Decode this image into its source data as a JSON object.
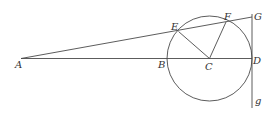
{
  "diagram": {
    "type": "geometry",
    "points": {
      "A": {
        "label": "A",
        "x": 21,
        "y": 58
      },
      "B": {
        "label": "B",
        "x": 167,
        "y": 58
      },
      "C": {
        "label": "C",
        "x": 209.5,
        "y": 58
      },
      "D": {
        "label": "D",
        "x": 252,
        "y": 58
      },
      "E": {
        "label": "E",
        "x": 178,
        "y": 31
      },
      "F": {
        "label": "F",
        "x": 226,
        "y": 21
      },
      "G": {
        "label": "G",
        "x": 252,
        "y": 17
      },
      "g": {
        "label": "g",
        "x": 252,
        "y": 107
      }
    },
    "circle": {
      "center": "C",
      "radius": 42.5
    },
    "segments": [
      [
        "A",
        "D"
      ],
      [
        "A",
        "G"
      ],
      [
        "C",
        "E"
      ],
      [
        "C",
        "F"
      ],
      [
        "G",
        "g"
      ]
    ]
  }
}
